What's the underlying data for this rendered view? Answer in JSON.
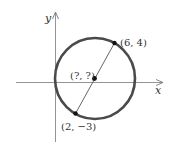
{
  "diagram": {
    "title": "",
    "axes": {
      "x_label": "x",
      "y_label": "y"
    },
    "circle": {
      "stroke_color": "#4a4a4a"
    },
    "points": [
      {
        "id": "endpoint-a",
        "label": "(6, 4)"
      },
      {
        "id": "center",
        "label": "(?, ?)"
      },
      {
        "id": "endpoint-b",
        "label": "(2, −3)"
      }
    ],
    "colors": {
      "axis": "#777777",
      "point": "#111111",
      "text": "#333333"
    }
  }
}
